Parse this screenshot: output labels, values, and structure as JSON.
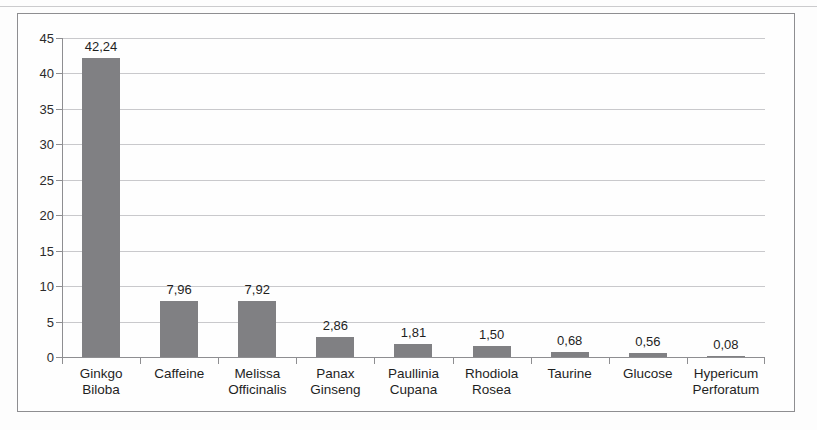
{
  "chart_data": {
    "type": "bar",
    "title": "",
    "subtitle": "",
    "xlabel": "",
    "ylabel": "",
    "ylim": [
      0,
      45
    ],
    "yticks": [
      0,
      5,
      10,
      15,
      20,
      25,
      30,
      35,
      40,
      45
    ],
    "ytick_labels": [
      "0",
      "5",
      "10",
      "15",
      "20",
      "25",
      "30",
      "35",
      "40",
      "45"
    ],
    "grid": true,
    "legend": false,
    "decimal_separator": ",",
    "bar_color": "#808083",
    "gridline_color": "#c9c9cc",
    "axis_color": "#8e8e91",
    "categories": [
      "Ginkgo Biloba",
      "Caffeine",
      "Melissa Officinalis",
      "Panax Ginseng",
      "Paullinia Cupana",
      "Rhodiola Rosea",
      "Taurine",
      "Glucose",
      "Hypericum Perforatum"
    ],
    "category_lines": [
      [
        "Ginkgo",
        "Biloba"
      ],
      [
        "Caffeine"
      ],
      [
        "Melissa",
        "Officinalis"
      ],
      [
        "Panax",
        "Ginseng"
      ],
      [
        "Paullinia",
        "Cupana"
      ],
      [
        "Rhodiola",
        "Rosea"
      ],
      [
        "Taurine"
      ],
      [
        "Glucose"
      ],
      [
        "Hypericum",
        "Perforatum"
      ]
    ],
    "values": [
      42.24,
      7.96,
      7.92,
      2.86,
      1.81,
      1.5,
      0.68,
      0.56,
      0.08
    ],
    "value_labels": [
      "42,24",
      "7,96",
      "7,92",
      "2,86",
      "1,81",
      "1,50",
      "0,68",
      "0,56",
      "0,08"
    ]
  }
}
